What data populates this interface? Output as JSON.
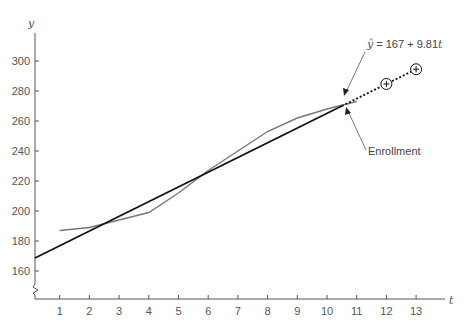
{
  "chart_data": {
    "type": "line",
    "title": "",
    "xlabel": "t",
    "ylabel": "y",
    "x": [
      1,
      2,
      3,
      4,
      5,
      6,
      7,
      8,
      9,
      10,
      11
    ],
    "xticks": [
      1,
      2,
      3,
      4,
      5,
      6,
      7,
      8,
      9,
      10,
      11,
      12,
      13
    ],
    "yticks": [
      160,
      180,
      200,
      220,
      240,
      260,
      280,
      300
    ],
    "xlim": [
      0,
      14
    ],
    "ylim": [
      150,
      315
    ],
    "y_axis_break": true,
    "grid": false,
    "legend": "none (inline annotations)",
    "series": [
      {
        "name": "Enrollment",
        "style": "solid gray line",
        "x": [
          1,
          2,
          3,
          4,
          5,
          6,
          7,
          8,
          9,
          10,
          11
        ],
        "values": [
          187,
          189,
          194,
          199,
          212,
          227,
          240,
          253,
          262,
          268,
          273
        ]
      },
      {
        "name": "Trend line",
        "equation": "ŷ = 167 + 9.81t",
        "intercept": 167,
        "slope": 9.81,
        "style": "solid black line from t=0 to t≈10.5, dotted extension to t=13",
        "x": [
          0,
          10.5,
          13
        ],
        "values": [
          167,
          270.0,
          294.5
        ]
      },
      {
        "name": "Forecasts",
        "style": "circled plus markers on dotted extension",
        "x": [
          12,
          13
        ],
        "values": [
          284.7,
          294.5
        ]
      }
    ],
    "annotations": [
      {
        "text": "ŷ = 167 + 9.81t",
        "points_to": "trend line near t≈10.5"
      },
      {
        "text": "Enrollment",
        "points_to": "enrollment curve near t≈10.5"
      }
    ]
  },
  "labels": {
    "y_axis_title": "y",
    "x_axis_title": "t",
    "equation_yhat": "ŷ",
    "equation_rest": " = 167 + 9.81",
    "equation_t": "t",
    "enrollment": "Enrollment",
    "forecast_marker": "+"
  },
  "colors": {
    "axis": "#555555",
    "trend": "#111111",
    "enrollment": "#777777",
    "text": "#555555"
  }
}
